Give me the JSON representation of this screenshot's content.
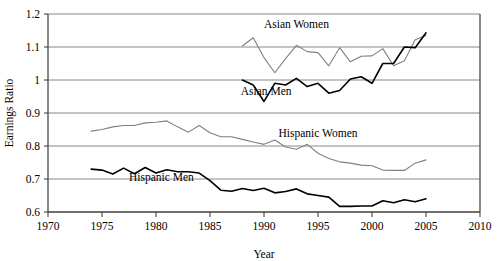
{
  "chart_data": {
    "type": "line",
    "title": "",
    "xlabel": "Year",
    "ylabel": "Earnings Ratio",
    "xlim": [
      1970,
      2010
    ],
    "ylim": [
      0.6,
      1.2
    ],
    "xticks": [
      1970,
      1975,
      1980,
      1985,
      1990,
      1995,
      2000,
      2005,
      2010
    ],
    "yticks": [
      0.6,
      0.7,
      0.8,
      0.9,
      1.0,
      1.1,
      1.2
    ],
    "ytick_labels": [
      "0.6",
      "0.7",
      "0.8",
      "0.9",
      "1",
      "1.1",
      "1.2"
    ],
    "xtick_labels": [
      "1970",
      "1975",
      "1980",
      "1985",
      "1990",
      "1995",
      "2000",
      "2005",
      "2010"
    ],
    "grid": "horizontal",
    "legend": "inline-annotations",
    "series": [
      {
        "name": "Asian Women",
        "color": "#808080",
        "width": 1.1,
        "label_x": 1993.0,
        "label_y": 1.158,
        "x": [
          1988,
          1989,
          1990,
          1991,
          1992,
          1993,
          1994,
          1995,
          1996,
          1997,
          1998,
          1999,
          2000,
          2001,
          2002,
          2003,
          2004,
          2005
        ],
        "y": [
          1.103,
          1.128,
          1.068,
          1.022,
          1.065,
          1.105,
          1.086,
          1.083,
          1.043,
          1.098,
          1.055,
          1.072,
          1.073,
          1.095,
          1.043,
          1.058,
          1.122,
          1.135
        ]
      },
      {
        "name": "Asian Men",
        "color": "#000000",
        "width": 1.6,
        "label_x": 1990.2,
        "label_y": 0.955,
        "x": [
          1988,
          1989,
          1990,
          1991,
          1992,
          1993,
          1994,
          1995,
          1996,
          1997,
          1998,
          1999,
          2000,
          2001,
          2002,
          2003,
          2004,
          2005
        ],
        "y": [
          1.0,
          0.985,
          0.935,
          0.99,
          0.985,
          1.005,
          0.98,
          0.99,
          0.96,
          0.968,
          1.003,
          1.01,
          0.99,
          1.05,
          1.05,
          1.1,
          1.098,
          1.143
        ]
      },
      {
        "name": "Hispanic Women",
        "color": "#808080",
        "width": 1.1,
        "label_x": 1995.0,
        "label_y": 0.828,
        "x": [
          1974,
          1975,
          1976,
          1977,
          1978,
          1979,
          1980,
          1981,
          1982,
          1983,
          1984,
          1985,
          1986,
          1987,
          1988,
          1989,
          1990,
          1991,
          1992,
          1993,
          1994,
          1995,
          1996,
          1997,
          1998,
          1999,
          2000,
          2001,
          2002,
          2003,
          2004,
          2005
        ],
        "y": [
          0.845,
          0.85,
          0.858,
          0.862,
          0.862,
          0.87,
          0.872,
          0.876,
          0.858,
          0.842,
          0.862,
          0.84,
          0.828,
          0.828,
          0.82,
          0.812,
          0.805,
          0.818,
          0.797,
          0.79,
          0.805,
          0.778,
          0.762,
          0.752,
          0.748,
          0.742,
          0.74,
          0.727,
          0.726,
          0.726,
          0.748,
          0.758
        ]
      },
      {
        "name": "Hispanic Men",
        "color": "#000000",
        "width": 1.6,
        "label_x": 1980.5,
        "label_y": 0.694,
        "x": [
          1974,
          1975,
          1976,
          1977,
          1978,
          1979,
          1980,
          1981,
          1982,
          1983,
          1984,
          1985,
          1986,
          1987,
          1988,
          1989,
          1990,
          1991,
          1992,
          1993,
          1994,
          1995,
          1996,
          1997,
          1998,
          1999,
          2000,
          2001,
          2002,
          2003,
          2004,
          2005
        ],
        "y": [
          0.73,
          0.727,
          0.715,
          0.733,
          0.716,
          0.735,
          0.718,
          0.728,
          0.722,
          0.722,
          0.718,
          0.695,
          0.666,
          0.663,
          0.671,
          0.665,
          0.672,
          0.658,
          0.662,
          0.67,
          0.655,
          0.65,
          0.645,
          0.617,
          0.617,
          0.618,
          0.618,
          0.634,
          0.628,
          0.637,
          0.631,
          0.64
        ]
      }
    ]
  }
}
